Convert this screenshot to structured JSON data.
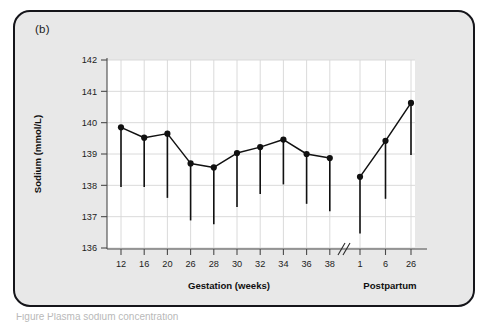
{
  "figure": {
    "panel_label": "(b)",
    "caption_partial": "Figure  Plasma sodium concentration",
    "background_color": "#e8e8e8",
    "border_color": "#15151a",
    "plot_background": "#ffffff",
    "grid_color": "#d6d6d6",
    "data_color": "#111111"
  },
  "chart_data": {
    "type": "line",
    "title": "",
    "xlabel": "Gestation (weeks)",
    "xlabel_secondary": "Postpartum",
    "ylabel": "Sodium (mmol/L)",
    "ylim": [
      136,
      142
    ],
    "yticks": [
      136,
      137,
      138,
      139,
      140,
      141,
      142
    ],
    "ytick_labels": [
      "136",
      "137",
      "138",
      "139",
      "140",
      "141",
      "142"
    ],
    "grid": true,
    "legend": null,
    "axis_break": "//",
    "segments": [
      {
        "name": "Gestation (weeks)",
        "categories": [
          "12",
          "16",
          "20",
          "26",
          "28",
          "30",
          "32",
          "34",
          "36",
          "38"
        ],
        "values": [
          139.85,
          139.52,
          139.65,
          138.7,
          138.57,
          139.03,
          139.22,
          139.46,
          139.0,
          138.87
        ],
        "range_low": [
          137.95,
          137.95,
          137.6,
          136.88,
          136.76,
          137.31,
          137.72,
          138.03,
          137.41,
          137.17
        ]
      },
      {
        "name": "Postpartum",
        "categories": [
          "1",
          "6",
          "26"
        ],
        "values": [
          138.27,
          139.42,
          140.63
        ],
        "range_low": [
          136.46,
          137.57,
          138.97
        ]
      }
    ],
    "series_note": "Mean value marker with vertical range bar extending to lower limit"
  }
}
